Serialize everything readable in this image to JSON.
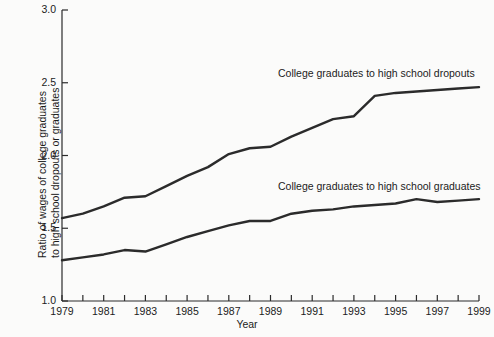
{
  "chart_data": {
    "type": "line",
    "title": "",
    "xlabel": "Year",
    "ylabel": "Ratio of wages of college graduates to high school dropouts or graduates",
    "ylabel_line1": "Ratio of wages of college graduates",
    "ylabel_line2": "to high school dropouts or graduates",
    "xlim": [
      1979,
      1999
    ],
    "ylim": [
      1.0,
      3.0
    ],
    "grid": false,
    "legend_position": "inline-annotations",
    "ytick_labels": [
      "1.0",
      "1.5",
      "2.0",
      "2.5",
      "3.0"
    ],
    "ytick_values": [
      1.0,
      1.5,
      2.0,
      2.5,
      3.0
    ],
    "xtick_labels": [
      "1979",
      "1981",
      "1983",
      "1985",
      "1987",
      "1989",
      "1991",
      "1993",
      "1995",
      "1997",
      "1999"
    ],
    "xtick_values": [
      1979,
      1981,
      1983,
      1985,
      1987,
      1989,
      1991,
      1993,
      1995,
      1997,
      1999
    ],
    "xtick_minor_values": [
      1980,
      1982,
      1984,
      1986,
      1988,
      1990,
      1992,
      1994,
      1996,
      1998
    ],
    "x": [
      1979,
      1980,
      1981,
      1982,
      1983,
      1984,
      1985,
      1986,
      1987,
      1988,
      1989,
      1990,
      1991,
      1992,
      1993,
      1994,
      1995,
      1996,
      1997,
      1998,
      1999
    ],
    "series": [
      {
        "name": "College graduates to high school dropouts",
        "label": "College graduates to high school dropouts",
        "color": "#2b2b2b",
        "values": [
          1.57,
          1.6,
          1.65,
          1.71,
          1.72,
          1.79,
          1.86,
          1.92,
          2.01,
          2.05,
          2.06,
          2.13,
          2.19,
          2.25,
          2.27,
          2.41,
          2.43,
          2.44,
          2.45,
          2.46,
          2.47
        ]
      },
      {
        "name": "College graduates to high school graduates",
        "label": "College graduates to high school graduates",
        "color": "#2b2b2b",
        "values": [
          1.28,
          1.3,
          1.32,
          1.35,
          1.34,
          1.39,
          1.44,
          1.48,
          1.52,
          1.55,
          1.55,
          1.6,
          1.62,
          1.63,
          1.65,
          1.66,
          1.67,
          1.7,
          1.68,
          1.69,
          1.7
        ]
      }
    ]
  },
  "axes": {
    "xlabel": "Year"
  }
}
